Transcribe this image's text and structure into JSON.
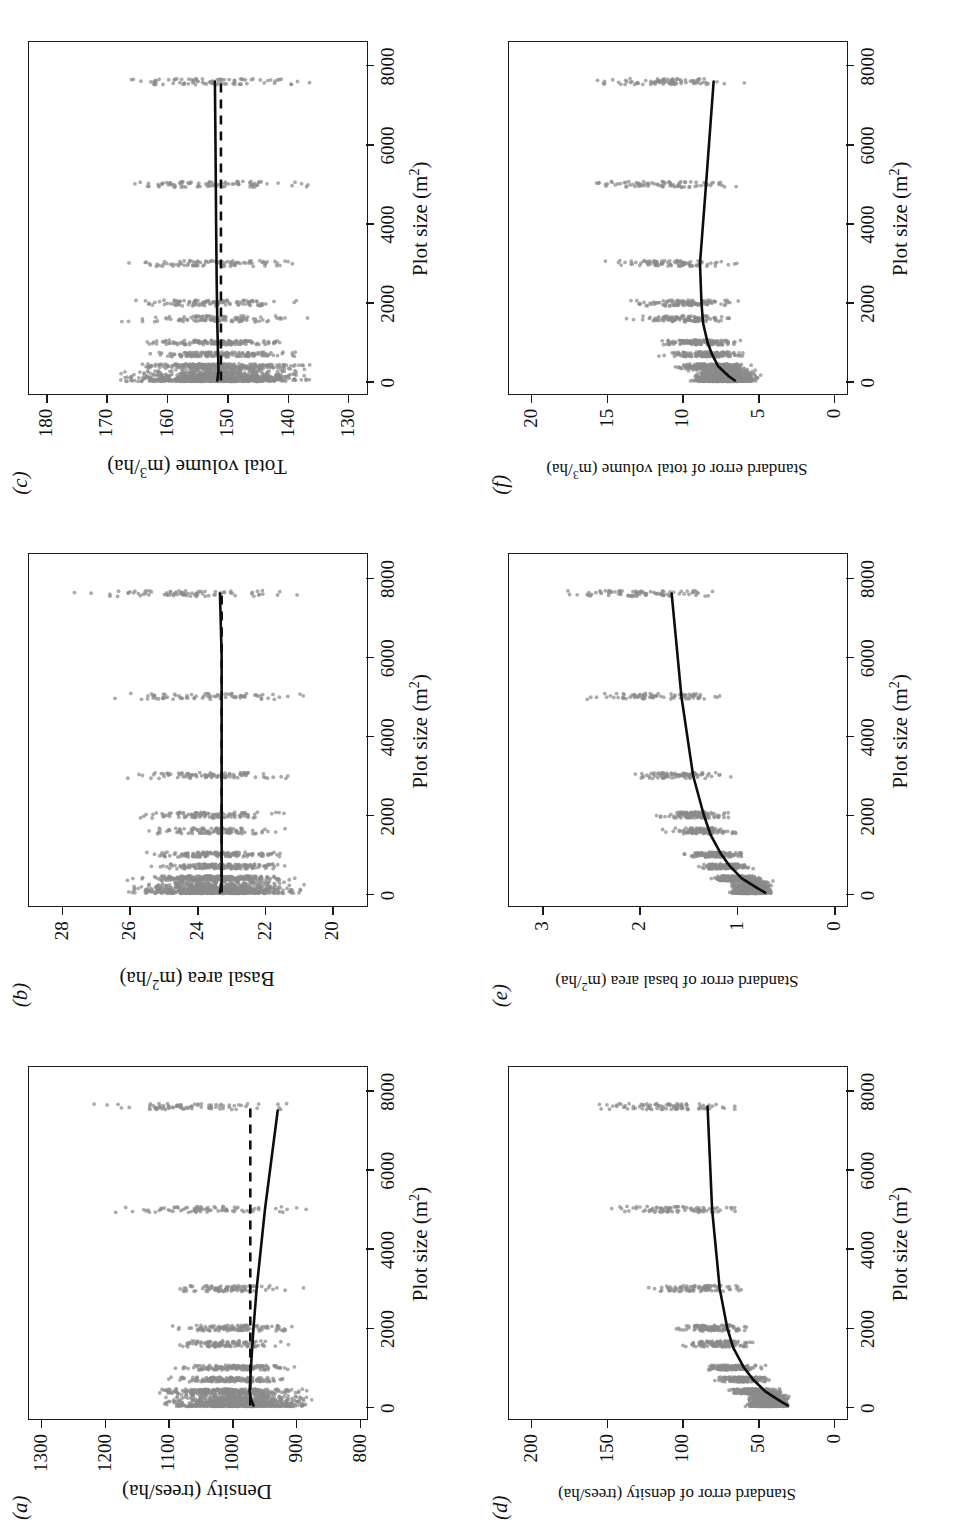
{
  "figure": {
    "layout": "3 columns x 2 rows, rotated 90 degrees counter-clockwise on the page",
    "point_color": "#8a8a8a",
    "line_color": "#0d0d0d"
  },
  "shared": {
    "xlabel_main": "Plot size (m",
    "xlabel_sup": "2",
    "xlabel_tail": ")",
    "xticks": [
      "0",
      "2000",
      "4000",
      "6000",
      "8000"
    ]
  },
  "panels": [
    {
      "letter": "(a)",
      "ylabel_parts": [
        "Density (trees/ha)"
      ],
      "yticks": [
        "800",
        "900",
        "1000",
        "1100",
        "1200",
        "1300"
      ]
    },
    {
      "letter": "(b)",
      "ylabel_parts": [
        "Basal area (m",
        "2",
        "/ha)"
      ],
      "yticks": [
        "20",
        "22",
        "24",
        "26",
        "28"
      ]
    },
    {
      "letter": "(c)",
      "ylabel_parts": [
        "Total volume (m",
        "3",
        "/ha)"
      ],
      "yticks": [
        "130",
        "140",
        "150",
        "160",
        "170",
        "180"
      ]
    },
    {
      "letter": "(d)",
      "ylabel_parts": [
        "Standard error of density (trees/ha)"
      ],
      "yticks": [
        "0",
        "50",
        "100",
        "150",
        "200"
      ]
    },
    {
      "letter": "(e)",
      "ylabel_parts": [
        "Standard error of basal area (m",
        "2",
        "/ha)"
      ],
      "yticks": [
        "0",
        "1",
        "2",
        "3"
      ]
    },
    {
      "letter": "(f)",
      "ylabel_parts": [
        "Standard error of total volume (m",
        "3",
        "/ha)"
      ],
      "yticks": [
        "0",
        "5",
        "10",
        "15",
        "20"
      ]
    }
  ],
  "chart_data": [
    {
      "id": "a",
      "type": "scatter",
      "title": "(a)",
      "xlabel": "Plot size (m2)",
      "ylabel": "Density (trees/ha)",
      "xlim": [
        -300,
        8600
      ],
      "ylim": [
        790,
        1320
      ],
      "xticks": [
        0,
        2000,
        4000,
        6000,
        8000
      ],
      "yticks": [
        800,
        900,
        1000,
        1100,
        1200,
        1300
      ],
      "grid": false,
      "legend": "none",
      "series": [
        {
          "name": "smoothed fit (solid)",
          "style": "solid",
          "x": [
            40,
            200,
            400,
            700,
            1000,
            1500,
            2000,
            3000,
            5000,
            7500
          ],
          "y": [
            968,
            972,
            974,
            973,
            972,
            970,
            968,
            963,
            950,
            930
          ]
        },
        {
          "name": "overall mean (dashed)",
          "style": "dashed",
          "x": [
            40,
            7600
          ],
          "y": [
            973,
            973
          ]
        }
      ],
      "point_clusters": [
        {
          "x": 100,
          "y_range": [
            855,
            1130
          ],
          "n": 900
        },
        {
          "x": 400,
          "y_range": [
            870,
            1160
          ],
          "n": 250
        },
        {
          "x": 700,
          "y_range": [
            880,
            1120
          ],
          "n": 160
        },
        {
          "x": 1000,
          "y_range": [
            880,
            1110
          ],
          "n": 140
        },
        {
          "x": 1600,
          "y_range": [
            890,
            1115
          ],
          "n": 110
        },
        {
          "x": 2000,
          "y_range": [
            885,
            1120
          ],
          "n": 110
        },
        {
          "x": 3000,
          "y_range": [
            880,
            1140
          ],
          "n": 90
        },
        {
          "x": 5000,
          "y_range": [
            865,
            1215
          ],
          "n": 80
        },
        {
          "x": 7600,
          "y_range": [
            860,
            1265
          ],
          "n": 80
        }
      ]
    },
    {
      "id": "b",
      "type": "scatter",
      "title": "(b)",
      "xlabel": "Plot size (m2)",
      "ylabel": "Basal area (m2/ha)",
      "xlim": [
        -300,
        8600
      ],
      "ylim": [
        19.0,
        29.0
      ],
      "xticks": [
        0,
        2000,
        4000,
        6000,
        8000
      ],
      "yticks": [
        20,
        22,
        24,
        26,
        28
      ],
      "grid": false,
      "legend": "none",
      "series": [
        {
          "name": "smoothed fit (solid)",
          "style": "solid",
          "x": [
            40,
            300,
            800,
            1500,
            2500,
            4000,
            6000,
            7600
          ],
          "y": [
            23.35,
            23.3,
            23.3,
            23.3,
            23.3,
            23.3,
            23.3,
            23.35
          ]
        },
        {
          "name": "overall mean (dashed)",
          "style": "dashed",
          "x": [
            40,
            7600
          ],
          "y": [
            23.3,
            23.3
          ]
        }
      ],
      "point_clusters": [
        {
          "x": 100,
          "y_range": [
            20.6,
            26.3
          ],
          "n": 900
        },
        {
          "x": 400,
          "y_range": [
            20.8,
            26.2
          ],
          "n": 240
        },
        {
          "x": 700,
          "y_range": [
            20.9,
            25.9
          ],
          "n": 160
        },
        {
          "x": 1000,
          "y_range": [
            21.0,
            25.9
          ],
          "n": 140
        },
        {
          "x": 1600,
          "y_range": [
            20.9,
            26.4
          ],
          "n": 110
        },
        {
          "x": 2000,
          "y_range": [
            20.7,
            26.5
          ],
          "n": 110
        },
        {
          "x": 3000,
          "y_range": [
            20.7,
            26.6
          ],
          "n": 90
        },
        {
          "x": 5000,
          "y_range": [
            20.5,
            27.0
          ],
          "n": 80
        },
        {
          "x": 7600,
          "y_range": [
            20.4,
            27.9
          ],
          "n": 80
        }
      ]
    },
    {
      "id": "c",
      "type": "scatter",
      "title": "(c)",
      "xlabel": "Plot size (m2)",
      "ylabel": "Total volume (m3/ha)",
      "xlim": [
        -300,
        8600
      ],
      "ylim": [
        127,
        183
      ],
      "xticks": [
        0,
        2000,
        4000,
        6000,
        8000
      ],
      "yticks": [
        130,
        140,
        150,
        160,
        170,
        180
      ],
      "grid": false,
      "legend": "none",
      "series": [
        {
          "name": "smoothed fit (solid)",
          "style": "solid",
          "x": [
            40,
            300,
            800,
            1500,
            2500,
            4000,
            6000,
            7600
          ],
          "y": [
            151.8,
            151.6,
            151.7,
            151.8,
            151.9,
            152.0,
            152.1,
            152.2
          ]
        },
        {
          "name": "overall mean (dashed)",
          "style": "dashed",
          "x": [
            40,
            7600
          ],
          "y": [
            151.2,
            151.2
          ]
        }
      ],
      "point_clusters": [
        {
          "x": 100,
          "y_range": [
            134,
            170
          ],
          "n": 950
        },
        {
          "x": 400,
          "y_range": [
            135,
            169
          ],
          "n": 250
        },
        {
          "x": 700,
          "y_range": [
            136,
            168
          ],
          "n": 160
        },
        {
          "x": 1000,
          "y_range": [
            136,
            168
          ],
          "n": 140
        },
        {
          "x": 1600,
          "y_range": [
            135,
            169
          ],
          "n": 110
        },
        {
          "x": 2000,
          "y_range": [
            134,
            170
          ],
          "n": 110
        },
        {
          "x": 3000,
          "y_range": [
            134,
            170
          ],
          "n": 90
        },
        {
          "x": 5000,
          "y_range": [
            133,
            172
          ],
          "n": 85
        },
        {
          "x": 7600,
          "y_range": [
            132,
            172
          ],
          "n": 85
        }
      ]
    },
    {
      "id": "d",
      "type": "scatter",
      "title": "(d)",
      "xlabel": "Plot size (m2)",
      "ylabel": "Standard error of density (trees/ha)",
      "xlim": [
        -300,
        8600
      ],
      "ylim": [
        -8,
        215
      ],
      "xticks": [
        0,
        2000,
        4000,
        6000,
        8000
      ],
      "yticks": [
        0,
        50,
        100,
        150,
        200
      ],
      "grid": false,
      "legend": "none",
      "series": [
        {
          "name": "smoothed fit (solid)",
          "style": "solid",
          "x": [
            40,
            150,
            400,
            700,
            1000,
            1500,
            2000,
            3000,
            5000,
            7600
          ],
          "y": [
            31,
            36,
            46,
            54,
            60,
            67,
            71,
            76,
            81,
            84
          ]
        }
      ],
      "point_clusters": [
        {
          "x": 100,
          "y_range": [
            28,
            60
          ],
          "n": 900
        },
        {
          "x": 400,
          "y_range": [
            33,
            72
          ],
          "n": 250
        },
        {
          "x": 700,
          "y_range": [
            38,
            82
          ],
          "n": 160
        },
        {
          "x": 1000,
          "y_range": [
            42,
            90
          ],
          "n": 140
        },
        {
          "x": 1600,
          "y_range": [
            47,
            105
          ],
          "n": 110
        },
        {
          "x": 2000,
          "y_range": [
            50,
            110
          ],
          "n": 110
        },
        {
          "x": 3000,
          "y_range": [
            52,
            130
          ],
          "n": 90
        },
        {
          "x": 5000,
          "y_range": [
            52,
            155
          ],
          "n": 85
        },
        {
          "x": 7600,
          "y_range": [
            52,
            175
          ],
          "n": 85
        }
      ]
    },
    {
      "id": "e",
      "type": "scatter",
      "title": "(e)",
      "xlabel": "Plot size (m2)",
      "ylabel": "Standard error of basal area (m2/ha)",
      "xlim": [
        -300,
        8600
      ],
      "ylim": [
        -0.12,
        3.35
      ],
      "xticks": [
        0,
        2000,
        4000,
        6000,
        8000
      ],
      "yticks": [
        0,
        1,
        2,
        3
      ],
      "grid": false,
      "legend": "none",
      "series": [
        {
          "name": "smoothed fit (solid)",
          "style": "solid",
          "x": [
            40,
            150,
            400,
            700,
            1000,
            1500,
            2000,
            3000,
            5000,
            7600
          ],
          "y": [
            0.72,
            0.8,
            0.96,
            1.08,
            1.17,
            1.28,
            1.35,
            1.46,
            1.58,
            1.68
          ]
        }
      ],
      "point_clusters": [
        {
          "x": 100,
          "y_range": [
            0.62,
            1.12
          ],
          "n": 900
        },
        {
          "x": 400,
          "y_range": [
            0.72,
            1.32
          ],
          "n": 250
        },
        {
          "x": 700,
          "y_range": [
            0.8,
            1.48
          ],
          "n": 160
        },
        {
          "x": 1000,
          "y_range": [
            0.86,
            1.62
          ],
          "n": 140
        },
        {
          "x": 1600,
          "y_range": [
            0.92,
            1.85
          ],
          "n": 110
        },
        {
          "x": 2000,
          "y_range": [
            0.96,
            1.95
          ],
          "n": 110
        },
        {
          "x": 3000,
          "y_range": [
            0.98,
            2.25
          ],
          "n": 90
        },
        {
          "x": 5000,
          "y_range": [
            0.95,
            2.7
          ],
          "n": 85
        },
        {
          "x": 7600,
          "y_range": [
            0.92,
            3.05
          ],
          "n": 85
        }
      ]
    },
    {
      "id": "f",
      "type": "scatter",
      "title": "(f)",
      "xlabel": "Plot size (m2)",
      "ylabel": "Standard error of total volume (m3/ha)",
      "xlim": [
        -300,
        8600
      ],
      "ylim": [
        -0.8,
        21.5
      ],
      "xticks": [
        0,
        2000,
        4000,
        6000,
        8000
      ],
      "yticks": [
        0,
        5,
        10,
        15,
        20
      ],
      "grid": false,
      "legend": "none",
      "series": [
        {
          "name": "smoothed fit (solid)",
          "style": "solid",
          "x": [
            40,
            150,
            400,
            700,
            1000,
            1500,
            2000,
            3000,
            5000,
            7600
          ],
          "y": [
            6.6,
            7.0,
            7.7,
            8.1,
            8.4,
            8.7,
            8.8,
            8.9,
            8.5,
            8.0
          ]
        }
      ],
      "point_clusters": [
        {
          "x": 100,
          "y_range": [
            4.6,
            9.8
          ],
          "n": 900
        },
        {
          "x": 400,
          "y_range": [
            5.0,
            11.0
          ],
          "n": 250
        },
        {
          "x": 700,
          "y_range": [
            5.2,
            12.0
          ],
          "n": 160
        },
        {
          "x": 1000,
          "y_range": [
            5.4,
            12.6
          ],
          "n": 140
        },
        {
          "x": 1600,
          "y_range": [
            5.4,
            14.2
          ],
          "n": 110
        },
        {
          "x": 2000,
          "y_range": [
            5.4,
            14.8
          ],
          "n": 110
        },
        {
          "x": 3000,
          "y_range": [
            5.2,
            16.0
          ],
          "n": 90
        },
        {
          "x": 5000,
          "y_range": [
            5.0,
            17.6
          ],
          "n": 85
        },
        {
          "x": 7600,
          "y_range": [
            4.9,
            17.0
          ],
          "n": 85
        }
      ]
    }
  ]
}
